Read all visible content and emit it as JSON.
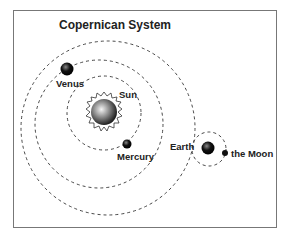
{
  "title": "Copernican System",
  "labels": {
    "sun": "Sun",
    "mercury": "Mercury",
    "venus": "Venus",
    "earth": "Earth",
    "moon": "the Moon"
  }
}
